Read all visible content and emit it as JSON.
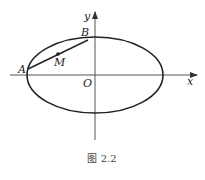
{
  "figure": {
    "caption": "图 2.2",
    "axes": {
      "x_label": "x",
      "y_label": "y",
      "origin_label": "O"
    },
    "points": {
      "A": {
        "label": "A"
      },
      "B": {
        "label": "B"
      },
      "M": {
        "label": "M"
      }
    },
    "shapes": [
      "ellipse centered at origin",
      "segment AB",
      "midpoint M of AB"
    ],
    "colors": {
      "stroke": "#222222",
      "axis": "#555555",
      "background": "#ffffff"
    }
  }
}
